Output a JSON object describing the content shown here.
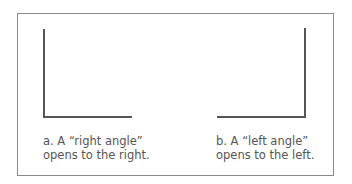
{
  "figure": {
    "panels": [
      {
        "id": "a",
        "shape": "right-angle",
        "caption_line1": "a. A “right angle”",
        "caption_line2": "opens to the right."
      },
      {
        "id": "b",
        "shape": "left-angle",
        "caption_line1": "b. A “left angle”",
        "caption_line2": "opens to the left."
      }
    ],
    "colors": {
      "line": "#555555",
      "border": "#8a8a8a",
      "text": "#555555"
    }
  }
}
